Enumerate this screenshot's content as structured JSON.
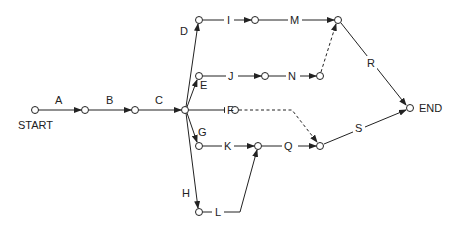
{
  "diagram": {
    "type": "activity-on-arrow network",
    "terminals": {
      "start": "START",
      "end": "END"
    },
    "activities": [
      "A",
      "B",
      "C",
      "D",
      "E",
      "F",
      "G",
      "H",
      "I",
      "J",
      "K",
      "L",
      "M",
      "N",
      "Q",
      "R",
      "S"
    ],
    "labels": {
      "A": "A",
      "B": "B",
      "C": "C",
      "D": "D",
      "E": "E",
      "F": "F",
      "G": "G",
      "H": "H",
      "I": "I",
      "J": "J",
      "K": "K",
      "L": "L",
      "M": "M",
      "N": "N",
      "Q": "Q",
      "R": "R",
      "S": "S"
    },
    "dummy_activities": [
      "F-to-Q-end (dashed)",
      "N-end-to-M-end (dashed)"
    ]
  }
}
